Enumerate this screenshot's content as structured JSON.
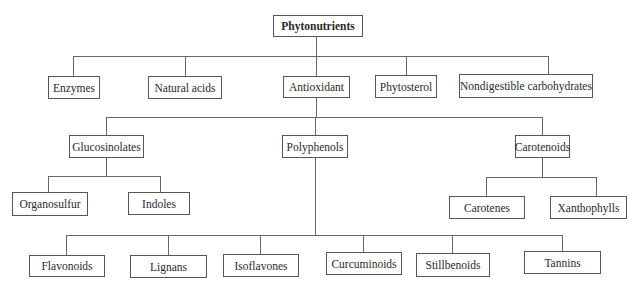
{
  "diagram": {
    "title": "Phytonutrients",
    "root": "Phytonutrients",
    "level1": [
      "Enzymes",
      "Natural acids",
      "Antioxidant",
      "Phytosterol",
      "Nondigestible carbohydrates"
    ],
    "antioxidant_children": [
      "Glucosinolates",
      "Polyphenols",
      "Carotenoids"
    ],
    "glucosinolates_children": [
      "Organosulfur",
      "Indoles"
    ],
    "carotenoids_children": [
      "Carotenes",
      "Xanthophylls"
    ],
    "polyphenols_children": [
      "Flavonoids",
      "Lignans",
      "Isoflavones",
      "Curcuminoids",
      "Stillbenoids",
      "Tannins"
    ]
  }
}
